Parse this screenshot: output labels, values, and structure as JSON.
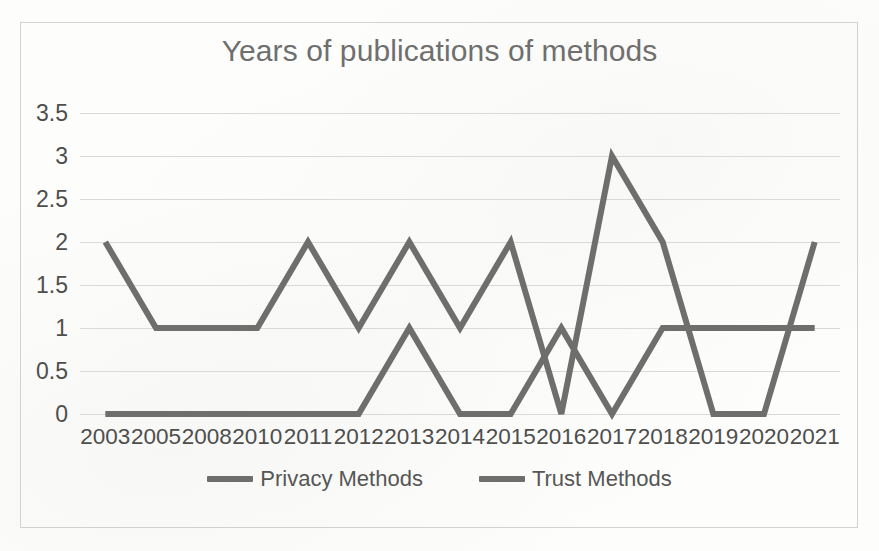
{
  "chart_data": {
    "type": "line",
    "title": "Years of publications of methods",
    "xlabel": "",
    "ylabel": "",
    "categories": [
      "2003",
      "2005",
      "2008",
      "2010",
      "2011",
      "2012",
      "2013",
      "2014",
      "2015",
      "2016",
      "2017",
      "2018",
      "2019",
      "2020",
      "2021"
    ],
    "yticks": [
      "0",
      "0.5",
      "1",
      "1.5",
      "2",
      "2.5",
      "3",
      "3.5"
    ],
    "ytick_values": [
      0,
      0.5,
      1,
      1.5,
      2,
      2.5,
      3,
      3.5
    ],
    "ylim": [
      0,
      3.5
    ],
    "grid": true,
    "legend_position": "bottom",
    "series": [
      {
        "name": "Privacy Methods",
        "color": "#6e6e6d",
        "values": [
          0,
          0,
          0,
          0,
          0,
          0,
          1,
          0,
          0,
          1,
          0,
          1,
          1,
          1,
          1
        ]
      },
      {
        "name": "Trust Methods",
        "color": "#6e6e6d",
        "values": [
          2,
          1,
          1,
          1,
          2,
          1,
          2,
          1,
          2,
          0,
          3,
          2,
          0,
          0,
          2
        ]
      }
    ]
  },
  "legend": {
    "items": [
      {
        "label": "Privacy Methods"
      },
      {
        "label": "Trust Methods"
      }
    ]
  },
  "colors": {
    "line": "#6e6e6d",
    "grid": "#d9d9d7",
    "frame": "#d2d2d0",
    "title_text": "#6f6f6e",
    "axis_text": "#4e4e4d"
  }
}
